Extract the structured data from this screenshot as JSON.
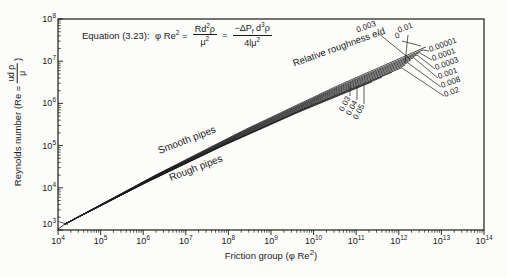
{
  "figure": {
    "equation": {
      "prefix": "Equation (3.23):",
      "lhs": "φ Re",
      "lhs_sup": "2",
      "eq": "=",
      "f1_num_a": "Rd",
      "f1_num_sup": "2",
      "f1_num_b": "ρ",
      "f1_den_a": "μ",
      "f1_den_sup": "2",
      "eq2": "=",
      "f2_num_a": "−ΔP",
      "f2_num_sub": "f",
      "f2_num_b": " d",
      "f2_num_sup": "3",
      "f2_num_c": "ρ",
      "f2_den_a": "4lμ",
      "f2_den_sup": "2"
    },
    "xlabel": {
      "pre": "Friction group (φ Re",
      "sup": "2",
      "post": ")"
    },
    "ylabel": {
      "pre": "Reynolds number (Re = ",
      "frac_num": "ud ρ",
      "frac_den": "μ",
      "post": ")"
    },
    "axis": {
      "base": "10",
      "x_exponents": [
        "4",
        "5",
        "6",
        "7",
        "8",
        "9",
        "10",
        "11",
        "12",
        "13",
        "14"
      ],
      "y_exponents": [
        "3",
        "4",
        "5",
        "6",
        "7",
        "8"
      ]
    }
  },
  "chart_data": {
    "type": "line",
    "xlabel": "Friction group (φ Re²)",
    "ylabel": "Reynolds number (Re = udρ/μ)",
    "x_scale": "log",
    "y_scale": "log",
    "xlim_exp": [
      4,
      14
    ],
    "ylim_exp": [
      3,
      8
    ],
    "grid": false,
    "legend": "inline-callouts",
    "annotations": [
      {
        "id": "smooth",
        "text": "Smooth pipes"
      },
      {
        "id": "rough",
        "text": "Rough pipes"
      },
      {
        "id": "roughness",
        "text": "Relative roughness e/d"
      }
    ],
    "laminar_segment_log": [
      [
        4.0,
        3.02
      ],
      [
        4.16,
        3.14
      ]
    ],
    "curves": [
      {
        "ed": "0",
        "start_log": [
          4.16,
          3.14
        ],
        "end_log": [
          12.64,
          7.34
        ],
        "label_side": "end"
      },
      {
        "ed": "0.00001",
        "start_log": [
          4.16,
          3.14
        ],
        "end_log": [
          12.57,
          7.27
        ],
        "label_side": "right"
      },
      {
        "ed": "0.0001",
        "start_log": [
          4.16,
          3.14
        ],
        "end_log": [
          12.5,
          7.21
        ],
        "label_side": "right"
      },
      {
        "ed": "0.0003",
        "start_log": [
          4.16,
          3.14
        ],
        "end_log": [
          12.43,
          7.15
        ],
        "label_side": "right"
      },
      {
        "ed": "0.001",
        "start_log": [
          4.16,
          3.14
        ],
        "end_log": [
          12.36,
          7.09
        ],
        "label_side": "right"
      },
      {
        "ed": "0.003",
        "start_log": [
          4.16,
          3.14
        ],
        "end_log": [
          12.29,
          7.03
        ],
        "label_side": "top"
      },
      {
        "ed": "0.008",
        "start_log": [
          4.16,
          3.14
        ],
        "end_log": [
          12.22,
          6.97
        ],
        "label_side": "right"
      },
      {
        "ed": "0.01",
        "start_log": [
          4.16,
          3.14
        ],
        "end_log": [
          12.15,
          6.91
        ],
        "label_side": "top"
      },
      {
        "ed": "0.02",
        "start_log": [
          4.16,
          3.14
        ],
        "end_log": [
          12.08,
          6.85
        ],
        "label_side": "right"
      },
      {
        "ed": "0.03",
        "start_log": [
          4.16,
          3.14
        ],
        "end_log": [
          11.84,
          6.74
        ],
        "label_side": "bottom"
      },
      {
        "ed": "0.04",
        "start_log": [
          4.16,
          3.14
        ],
        "end_log": [
          11.6,
          6.62
        ],
        "label_side": "bottom"
      },
      {
        "ed": "0.05",
        "start_log": [
          4.16,
          3.14
        ],
        "end_log": [
          11.37,
          6.51
        ],
        "label_side": "bottom"
      }
    ]
  }
}
